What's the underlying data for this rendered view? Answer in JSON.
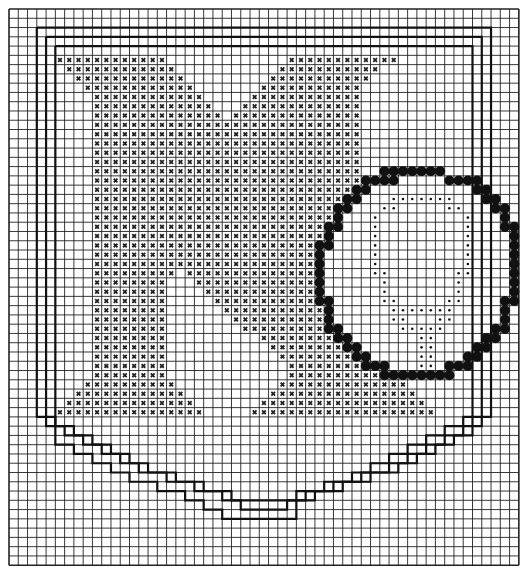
{
  "grid": {
    "cols": 55,
    "rows": 60,
    "origin_x": 9,
    "origin_y": 9,
    "cell": 9.27,
    "line_color": "#222222",
    "bg": "#ffffff"
  },
  "symbols": {
    "x": {
      "name": "cross-stitch",
      "glyph": "×",
      "color": "#222222"
    },
    "o": {
      "name": "filled-circle-stitch",
      "color": "#111111"
    },
    ":": {
      "name": "dot-stitch",
      "color": "#111111"
    }
  },
  "pattern": [
    ".......................................................",
    ".......................................................",
    ".......................................................",
    ".......................................................",
    ".......................................................",
    ".....xxxxxxxxxxxx.............xxxxxxxxxxxx.............",
    "......xxxxxxxxxxxx...........xxxxxxxxxxx...............",
    ".......xxxxxxxxxxxx.........xxxxxxxxxxx................",
    "........xxxxxxxxxxxx.......xxxxxxxxxxx.................",
    ".........xxxxxxxxxxxx.....xxxxxxxxxxxx.................",
    ".........xxxxxxxxxxxxx...xxxxxxxxxxxxx.................",
    ".........xxxxxxxxxxxxxx.xxxxxxxxxxxxxx.................",
    ".........xxxxxxxxxxxxxxxxxxxxxxxxxxxxx.................",
    ".........xxxxxxxxxxxxxxxxxxxxxxxxxxxxx.................",
    ".........xxxxxxxxxxxxxxxxxxxxxxxxxxxxx.................",
    ".........xxxxxxxxxxxxxxxxxxxxxxxxxxxxx.................",
    ".........xxxxxxxxxxxxxxxxxxxxxxxxxxxxx.................",
    ".........xxxxxxxxxxxxxxxxxxxxxxxxxxxxx..ooooooo........",
    ".........xxxxxxxxxxxxxxxxxxxxxxxxxxxxxoooo.....oooo....",
    ".........xxxxxxxxxxxxxxxxxxxxxxxxxxxxoo...........oo...",
    ".........xxxxxxxxxxxxxxxxxxxxxxxxxxxoo...:::::::...oo..",
    ".........xxxxxxxxxxxxxxxxxxxxxxxxxxoo...::.....::...oo.",
    ".........xxxxxxxxxxxxxxxxxxxxxxxxxxo...:.........:...o.",
    ".........xxxxxxxxxxxxxxxxxxxxxxxxxoo...:.........:...oo",
    ".........xxxxxxxxxxxxxxxxxxxxxxxxxo....:.........:....o",
    ".........xxxxxxxxxxxxxxxxxxxxxxxxoo....:.........:....o",
    ".........xxxxxxxxxxxxxxxxxxxxxxxxo.....:.........:....o",
    ".........xxxxxxxxxxxxxxxxxxxxxxxxo.....:.........:....o",
    ".........xxxxxxxxx.xxxxxxxxxxxxxxo.....::.......::....o",
    ".........xxxxxxxx...xxxxxxxxxxxxxo......:.......:.....o",
    ".........xxxxxxxx....xxxxxxxxxxxxo......:.......:.....o",
    ".........xxxxxxxx.....xxxxxxxxxxxoo.....::.....::....oo",
    ".........xxxxxxxx......xxxxxxxxxxxo......:::::::.....o.",
    ".........xxxxxxxx.......xxxxxxxxxxo......::...::.....o.",
    ".........xxxxxxxx........xxxxxxxxxoo......:::::.....oo.",
    ".........xxxxxxxx..........xxxxxxxxoo.......::.....oo..",
    ".........xxxxxxxx...........xxxxxxxxoo......::....oo...",
    ".........xxxxxxxx............xxxxxxxxoo.....::...oo....",
    ".........xxxxxxxx.............xxxxxxxxooo...::.ooo.....",
    ".........xxxxxxxx.............xxxxxxxxxxoooooooo.......",
    "........xxxxxxxxxx...........xxxxxxxxxxxxxx............",
    ".......xxxxxxxxxxxx.........xxxxxxxxxxxxxxxx...........",
    "......xxxxxxxxxxxxxx.......xxxxxxxxxxxxxxxxxx..........",
    ".....xxxxxxxxxxxxxxxx.....xxxxxxxxxxxxxxxxxxxx.........",
    ".......................................................",
    ".......................................................",
    ".......................................................",
    ".......................................................",
    ".......................................................",
    ".......................................................",
    ".......................................................",
    ".......................................................",
    ".......................................................",
    ".......................................................",
    ".......................................................",
    ".......................................................",
    ".......................................................",
    ".......................................................",
    ".......................................................",
    "......................................................."
  ],
  "frames": [
    {
      "name": "outer-frame",
      "points": [
        [
          3,
          2
        ],
        [
          52,
          2
        ],
        [
          52,
          44
        ],
        [
          49,
          44
        ],
        [
          49,
          45
        ],
        [
          47,
          45
        ],
        [
          47,
          46
        ],
        [
          45,
          46
        ],
        [
          45,
          47
        ],
        [
          43,
          47
        ],
        [
          43,
          48
        ],
        [
          41,
          48
        ],
        [
          41,
          49
        ],
        [
          39,
          49
        ],
        [
          39,
          50
        ],
        [
          37,
          50
        ],
        [
          37,
          51
        ],
        [
          34,
          51
        ],
        [
          34,
          52
        ],
        [
          31,
          52
        ],
        [
          31,
          53
        ],
        [
          24,
          53
        ],
        [
          24,
          52
        ],
        [
          21,
          52
        ],
        [
          21,
          51
        ],
        [
          18,
          51
        ],
        [
          18,
          50
        ],
        [
          15,
          50
        ],
        [
          15,
          49
        ],
        [
          13,
          49
        ],
        [
          13,
          48
        ],
        [
          11,
          48
        ],
        [
          11,
          47
        ],
        [
          9,
          47
        ],
        [
          9,
          46
        ],
        [
          7,
          46
        ],
        [
          7,
          45
        ],
        [
          5,
          45
        ],
        [
          5,
          44
        ],
        [
          3,
          44
        ],
        [
          3,
          2
        ]
      ]
    },
    {
      "name": "middle-frame",
      "points": [
        [
          4,
          3
        ],
        [
          51,
          3
        ],
        [
          51,
          45
        ],
        [
          49,
          45
        ],
        [
          49,
          46
        ],
        [
          47,
          46
        ],
        [
          47,
          47
        ],
        [
          45,
          47
        ],
        [
          45,
          48
        ],
        [
          43,
          48
        ],
        [
          43,
          49
        ],
        [
          41,
          49
        ],
        [
          41,
          50
        ],
        [
          38,
          50
        ],
        [
          38,
          51
        ],
        [
          35,
          51
        ],
        [
          35,
          52
        ],
        [
          32,
          52
        ],
        [
          32,
          53
        ],
        [
          30,
          53
        ],
        [
          30,
          54
        ],
        [
          25,
          54
        ],
        [
          25,
          53
        ],
        [
          23,
          53
        ],
        [
          23,
          52
        ],
        [
          20,
          52
        ],
        [
          20,
          51
        ],
        [
          17,
          51
        ],
        [
          17,
          50
        ],
        [
          14,
          50
        ],
        [
          14,
          49
        ],
        [
          12,
          49
        ],
        [
          12,
          48
        ],
        [
          10,
          48
        ],
        [
          10,
          47
        ],
        [
          8,
          47
        ],
        [
          8,
          46
        ],
        [
          6,
          46
        ],
        [
          6,
          45
        ],
        [
          4,
          45
        ],
        [
          4,
          3
        ]
      ]
    },
    {
      "name": "inner-frame",
      "points": [
        [
          5,
          4
        ],
        [
          50,
          4
        ],
        [
          50,
          46
        ],
        [
          48,
          46
        ],
        [
          48,
          47
        ],
        [
          46,
          47
        ],
        [
          46,
          48
        ],
        [
          44,
          48
        ],
        [
          44,
          49
        ],
        [
          42,
          49
        ],
        [
          42,
          50
        ],
        [
          39,
          50
        ],
        [
          39,
          51
        ],
        [
          36,
          51
        ],
        [
          36,
          52
        ],
        [
          33,
          52
        ],
        [
          33,
          53
        ],
        [
          31,
          53
        ],
        [
          31,
          55
        ],
        [
          23,
          55
        ],
        [
          23,
          54
        ],
        [
          21,
          54
        ],
        [
          21,
          53
        ],
        [
          19,
          53
        ],
        [
          19,
          52
        ],
        [
          16,
          52
        ],
        [
          16,
          51
        ],
        [
          13,
          51
        ],
        [
          13,
          50
        ],
        [
          11,
          50
        ],
        [
          11,
          49
        ],
        [
          9,
          49
        ],
        [
          9,
          48
        ],
        [
          7,
          48
        ],
        [
          7,
          47
        ],
        [
          5,
          47
        ],
        [
          5,
          4
        ]
      ]
    }
  ]
}
